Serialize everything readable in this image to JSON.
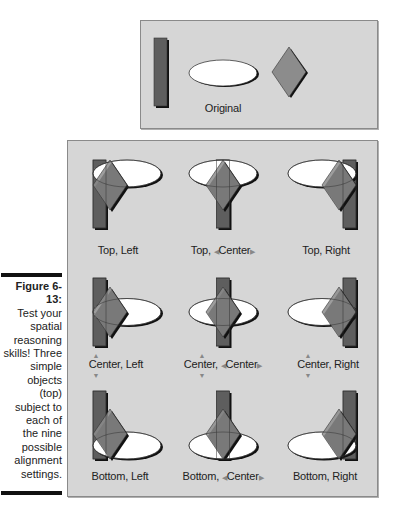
{
  "figure": {
    "number": "Figure 6-13:",
    "caption": "Test your spatial reasoning skills! Three simple objects (top) subject to each of the nine possible alignment settings.",
    "caption_lines": [
      "Test your",
      "spatial",
      "reasoning",
      "skills! Three",
      "simple",
      "objects",
      "(top)",
      "subject to",
      "each of",
      "the nine",
      "possible",
      "alignment",
      "settings."
    ]
  },
  "original": {
    "label": "Original"
  },
  "colors": {
    "panel": "#d6d6d6",
    "rect": "#5e5e5e",
    "ellipse": "#ffffff",
    "diamond": "#8c8c8c",
    "shadow": "#111111"
  },
  "icons": {
    "horizontal_arrows": "left-right-arrows-icon",
    "vertical_arrows": "up-down-arrows-icon"
  },
  "cells": [
    {
      "label": "Top, Left",
      "v": "Top",
      "h": "Left"
    },
    {
      "label_prefix": "Top, ",
      "label_center": "Center",
      "v": "Top",
      "h": "Center"
    },
    {
      "label": "Top, Right",
      "v": "Top",
      "h": "Right"
    },
    {
      "label": "Center, Left",
      "v": "Center",
      "h": "Left"
    },
    {
      "label_prefix": "Center, ",
      "label_center": "Center",
      "v": "Center",
      "h": "Center"
    },
    {
      "label": "Center, Right",
      "v": "Center",
      "h": "Right"
    },
    {
      "label": "Bottom, Left",
      "v": "Bottom",
      "h": "Left"
    },
    {
      "label_prefix": "Bottom, ",
      "label_center": "Center",
      "v": "Bottom",
      "h": "Center"
    },
    {
      "label": "Bottom, Right",
      "v": "Bottom",
      "h": "Right"
    }
  ]
}
